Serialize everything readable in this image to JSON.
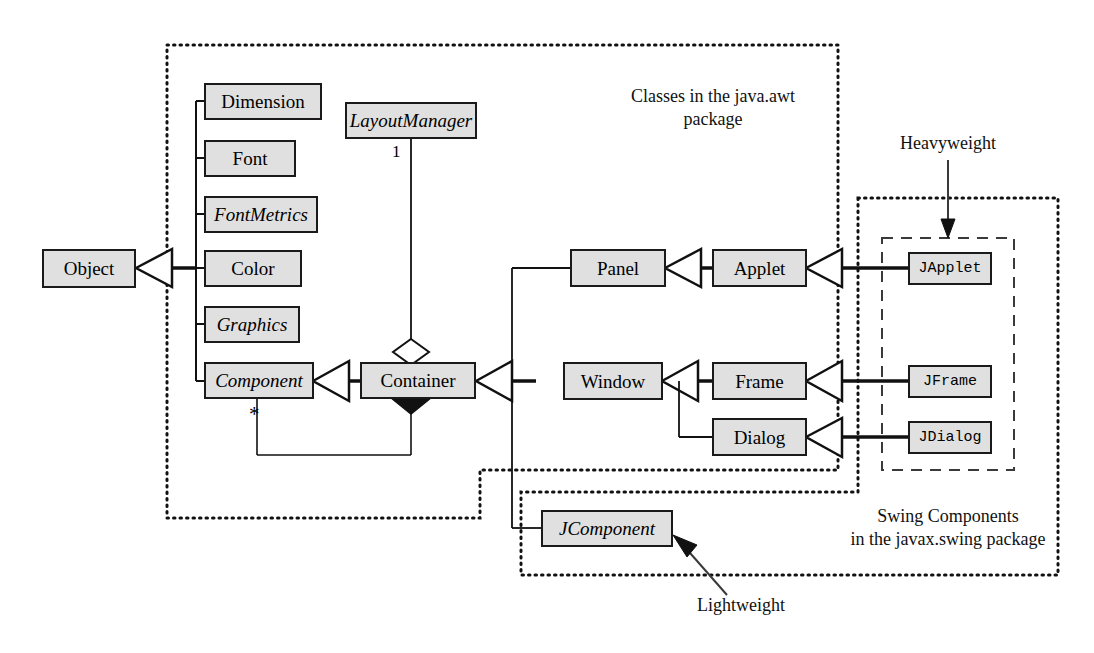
{
  "diagram": {
    "colors": {
      "box_fill": "#e0e0e0",
      "box_stroke": "#1a1a1a",
      "line": "#111111",
      "package_border": "#111111"
    }
  },
  "packages": {
    "awt": {
      "label_line1": "Classes in the java.awt",
      "label_line2": "package",
      "border_style": "dotted"
    },
    "swing": {
      "label_line1": "Swing Components",
      "label_line2": "in the javax.swing package",
      "border_style": "dotted"
    },
    "heavyweight_group": {
      "border_style": "dashed"
    }
  },
  "annotations": {
    "heavyweight": "Heavyweight",
    "lightweight": "Lightweight"
  },
  "multiplicities": {
    "layout_manager": "1",
    "component_star": "*"
  },
  "classes": {
    "object": {
      "name": "Object",
      "abstract": false,
      "package": "java.lang"
    },
    "dimension": {
      "name": "Dimension",
      "abstract": false,
      "package": "java.awt"
    },
    "font": {
      "name": "Font",
      "abstract": false,
      "package": "java.awt"
    },
    "font_metrics": {
      "name": "FontMetrics",
      "abstract": true,
      "package": "java.awt"
    },
    "color": {
      "name": "Color",
      "abstract": false,
      "package": "java.awt"
    },
    "graphics": {
      "name": "Graphics",
      "abstract": true,
      "package": "java.awt"
    },
    "component": {
      "name": "Component",
      "abstract": true,
      "package": "java.awt"
    },
    "layout_manager": {
      "name": "LayoutManager",
      "abstract": true,
      "package": "java.awt"
    },
    "container": {
      "name": "Container",
      "abstract": false,
      "package": "java.awt"
    },
    "panel": {
      "name": "Panel",
      "abstract": false,
      "package": "java.awt"
    },
    "applet": {
      "name": "Applet",
      "abstract": false,
      "package": "java.applet"
    },
    "window": {
      "name": "Window",
      "abstract": false,
      "package": "java.awt"
    },
    "frame": {
      "name": "Frame",
      "abstract": false,
      "package": "java.awt"
    },
    "dialog": {
      "name": "Dialog",
      "abstract": false,
      "package": "java.awt"
    },
    "japplet": {
      "name": "JApplet",
      "abstract": false,
      "package": "javax.swing"
    },
    "jframe": {
      "name": "JFrame",
      "abstract": false,
      "package": "javax.swing"
    },
    "jdialog": {
      "name": "JDialog",
      "abstract": false,
      "package": "javax.swing"
    },
    "jcomponent": {
      "name": "JComponent",
      "abstract": true,
      "package": "javax.swing"
    }
  }
}
